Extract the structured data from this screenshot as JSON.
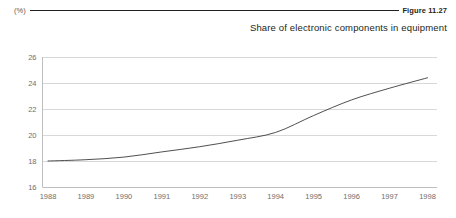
{
  "header": {
    "unit_label": "(%)",
    "figure_number": "Figure 11.27"
  },
  "chart_data": {
    "type": "line",
    "title": "Share of electronic components in equipment",
    "xlabel": "",
    "ylabel": "(%)",
    "categories": [
      "1988",
      "1989",
      "1990",
      "1991",
      "1992",
      "1993",
      "1994",
      "1995",
      "1996",
      "1997",
      "1998"
    ],
    "x": [
      1988,
      1989,
      1990,
      1991,
      1992,
      1993,
      1994,
      1995,
      1996,
      1997,
      1998
    ],
    "values": [
      18.0,
      18.1,
      18.3,
      18.7,
      19.1,
      19.6,
      20.2,
      21.5,
      22.7,
      23.6,
      24.4
    ],
    "series": [
      {
        "name": "Share of electronic components in equipment",
        "values": [
          18.0,
          18.1,
          18.3,
          18.7,
          19.1,
          19.6,
          20.2,
          21.5,
          22.7,
          23.6,
          24.4
        ]
      }
    ],
    "ylim": [
      16,
      26
    ],
    "yticks": [
      16,
      18,
      20,
      22,
      24,
      26
    ],
    "ytick_labels": [
      "16",
      "18",
      "20",
      "22",
      "24",
      "26"
    ],
    "xlim": [
      1988,
      1998
    ],
    "grid": "horizontal",
    "legend": "none",
    "line_color": "#3b3b3b",
    "grid_color": "#d7d8da",
    "axis_color": "#bcbec0"
  }
}
